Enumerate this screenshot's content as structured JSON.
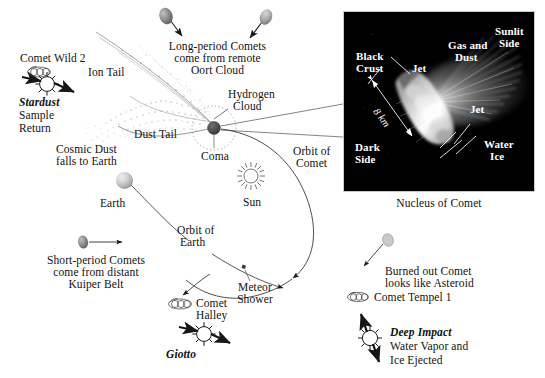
{
  "figure": {
    "background_color": "#ffffff",
    "ink_color": "#111111"
  },
  "labels": {
    "comet_wild_2": "Comet Wild 2",
    "stardust": "Stardust",
    "stardust_sub_1": "Sample",
    "stardust_sub_2": "Return",
    "ion_tail": "Ion Tail",
    "dust_tail": "Dust Tail",
    "cosmic_dust_1": "Cosmic Dust",
    "cosmic_dust_2": "falls to Earth",
    "long_period_1": "Long-period Comets",
    "long_period_2": "come from remote",
    "long_period_3": "Oort Cloud",
    "hydrogen_cloud_1": "Hydrogen",
    "hydrogen_cloud_2": "Cloud",
    "coma": "Coma",
    "orbit_of_comet_1": "Orbit of",
    "orbit_of_comet_2": "Comet",
    "sun": "Sun",
    "earth": "Earth",
    "orbit_of_earth_1": "Orbit of",
    "orbit_of_earth_2": "Earth",
    "short_period_1": "Short-period Comets",
    "short_period_2": "come from distant",
    "short_period_3": "Kuiper Belt",
    "meteor_shower_1": "Meteor",
    "meteor_shower_2": "Shower",
    "comet_halley_1": "Comet",
    "comet_halley_2": "Halley",
    "giotto": "Giotto",
    "nucleus_of_comet": "Nucleus of Comet",
    "burned_out_1": "Burned out Comet",
    "burned_out_2": "looks like Asteroid",
    "comet_tempel_1": "Comet Tempel 1",
    "deep_impact": "Deep Impact",
    "deep_impact_sub_1": "Water Vapor and",
    "deep_impact_sub_2": "Ice Ejected"
  },
  "nucleus_panel": {
    "background_color": "#000000",
    "border_color": "#c9c9c9",
    "labels": {
      "black_crust_1": "Black",
      "black_crust_2": "Crust",
      "jet_upper": "Jet",
      "gas_and_dust_1": "Gas and",
      "gas_and_dust_2": "Dust",
      "sunlit_side_1": "Sunlit",
      "sunlit_side_2": "Side",
      "jet_lower": "Jet",
      "dark_side_1": "Dark",
      "dark_side_2": "Side",
      "water_ice_1": "Water",
      "water_ice_2": "Ice",
      "scale": "8 km"
    }
  },
  "icons": {
    "comet_wild_2": "comet-glyph-icon",
    "comet_halley": "comet-glyph-icon",
    "comet_tempel_1": "comet-glyph-icon",
    "stardust": "spacecraft-burst-icon",
    "giotto": "spacecraft-burst-icon",
    "deep_impact": "spacecraft-burst-icon",
    "sun": "sun-rays-icon",
    "earth": "earth-sphere-icon",
    "long_period_comet_left": "comet-blob-icon",
    "long_period_comet_right": "comet-blob-icon",
    "short_period_comet": "comet-blob-icon",
    "burned_out_comet": "asteroid-blob-icon",
    "comet_nucleus": "comet-nucleus-photo"
  }
}
